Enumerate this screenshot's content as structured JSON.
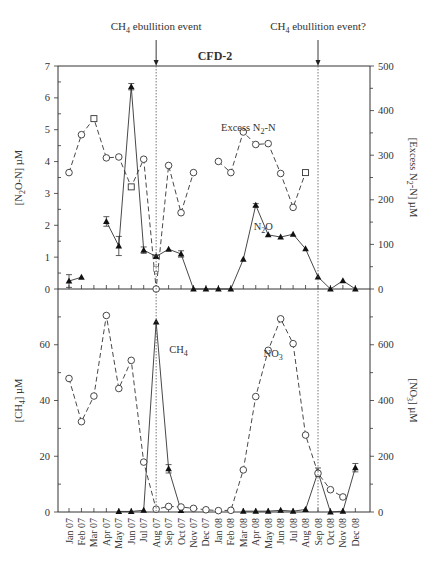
{
  "chart_data": {
    "type": "line",
    "title": "CFD-2",
    "x": [
      "Jan 07",
      "Feb 07",
      "Mar 07",
      "Apr 07",
      "May 07",
      "Jun 07",
      "Jul 07",
      "Aug 07",
      "Sep 07",
      "Oct 07",
      "Nov 07",
      "Dec 07",
      "Jan 08",
      "Feb 08",
      "Mar 08",
      "Apr 08",
      "May 08",
      "Jun 08",
      "Jul 08",
      "Aug 08",
      "Sep 08",
      "Oct 08",
      "Nov 08",
      "Dec 08"
    ],
    "annotations": [
      {
        "text": "CH4 ebullition event",
        "base": "CH",
        "sub": "4",
        "rest": " ebullition event",
        "x_index": 7
      },
      {
        "text": "CH4 ebullition event?",
        "base": "CH",
        "sub": "4",
        "rest": " ebullition event?",
        "x_index": 20
      }
    ],
    "panels": [
      {
        "name": "top",
        "left_axis": {
          "label": "[N2O-N] µM",
          "label_base": "[N",
          "label_sub": "2",
          "label_rest": "O-N] µM",
          "ylim": [
            0,
            7
          ],
          "ticks": [
            0,
            1,
            2,
            3,
            4,
            5,
            6,
            7
          ]
        },
        "right_axis": {
          "label": "[Excess N2-N] µM",
          "label_base": "[Excess N",
          "label_sub": "2",
          "label_rest": "-N] µM",
          "ylim": [
            0,
            500
          ],
          "ticks": [
            0,
            100,
            200,
            300,
            400,
            500
          ]
        },
        "series": [
          {
            "name": "N2O",
            "label_base": "N",
            "label_sub": "2",
            "label_rest": "O",
            "axis": "left",
            "marker": "triangle-filled",
            "line": "solid",
            "values": [
              0.25,
              0.37,
              null,
              2.12,
              1.35,
              6.35,
              1.22,
              1.02,
              1.25,
              1.1,
              0,
              0,
              0,
              0,
              0.93,
              2.63,
              1.7,
              1.63,
              1.72,
              1.26,
              0.38,
              0,
              0.26,
              0
            ],
            "error": [
              0.2,
              0,
              null,
              0.15,
              0.3,
              0.1,
              0.1,
              0.05,
              0,
              0.1,
              0,
              0,
              0,
              0,
              0,
              0.05,
              0,
              0,
              0,
              0,
              0,
              0,
              0,
              0
            ],
            "label_pos": {
              "x_index": 15.6,
              "value": 1.85
            }
          },
          {
            "name": "Excess N2-N",
            "label_base": "Excess N",
            "label_sub": "2",
            "label_rest": "-N",
            "axis": "right",
            "marker": "circle-open",
            "line": "dashed",
            "values": [
              261,
              346,
              382,
              294,
              296,
              229,
              291,
              0,
              277,
              171,
              261,
              null,
              286,
              261,
              352,
              324,
              326,
              259,
              183,
              261,
              null,
              null,
              null,
              null
            ],
            "square_points": [
              2,
              5,
              19
            ],
            "extra_square": {
              "x_index": 7,
              "value": 45
            },
            "label_pos": {
              "x_index": 14.4,
              "value": 355
            }
          }
        ]
      },
      {
        "name": "bottom",
        "left_axis": {
          "label": "[CH4] µM",
          "label_base": "[CH",
          "label_sub": "4",
          "label_rest": "] µM",
          "ylim": [
            0,
            80
          ],
          "ticks": [
            0,
            20,
            40,
            60
          ],
          "minor_ticks": [
            10,
            30,
            50,
            70
          ]
        },
        "right_axis": {
          "label": "[NO3] µM",
          "label_base": "[NO",
          "label_sub": "3",
          "label_rest": "] µM",
          "ylim": [
            0,
            800
          ],
          "ticks": [
            0,
            200,
            400,
            600
          ],
          "minor_ticks": [
            100,
            300,
            500,
            700
          ]
        },
        "series": [
          {
            "name": "CH4",
            "label_base": "CH",
            "label_sub": "4",
            "label_rest": "",
            "axis": "left",
            "marker": "triangle-filled",
            "line": "solid",
            "values": [
              null,
              null,
              null,
              null,
              0.2,
              0.2,
              0.6,
              68.2,
              15.5,
              0.5,
              null,
              null,
              null,
              null,
              0.3,
              0.3,
              0.3,
              0.6,
              0.3,
              0.9,
              14.3,
              0,
              0.3,
              15.9
            ],
            "error": [
              null,
              null,
              null,
              null,
              0,
              0,
              0,
              0,
              1.5,
              0,
              null,
              null,
              null,
              null,
              0,
              0,
              0,
              0,
              0,
              0,
              1.5,
              0,
              0,
              1.5
            ],
            "label_pos": {
              "x_index": 8.8,
              "value": 57
            }
          },
          {
            "name": "NO3",
            "label_base": "NO",
            "label_sub": "3",
            "label_rest": "",
            "axis": "right",
            "marker": "circle-open",
            "line": "dashed",
            "values": [
              479,
              324,
              416,
              705,
              443,
              544,
              179,
              10,
              20,
              18,
              13,
              8,
              5,
              6,
              151,
              414,
              580,
              693,
              604,
              276,
              139,
              80,
              54,
              null
            ],
            "label_pos": {
              "x_index": 16.4,
              "value": 555
            }
          }
        ]
      }
    ]
  }
}
